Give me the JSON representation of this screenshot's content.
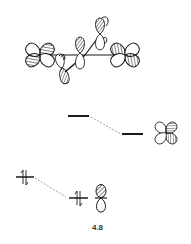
{
  "figure": {
    "label": "4.8"
  },
  "levels": {
    "left_upper": {
      "electrons": 0
    },
    "right_upper": {
      "electrons": 0,
      "orbital": "d-orbital (four-lobe)"
    },
    "left_lower": {
      "electrons": 2,
      "symbol": "↑↓"
    },
    "right_lower": {
      "electrons": 2,
      "symbol": "↑↓",
      "orbital": "hybrid lobe"
    }
  },
  "colors": {
    "ink": "#1a1a1a",
    "dashed": "#888888",
    "background": "#ffffff"
  }
}
